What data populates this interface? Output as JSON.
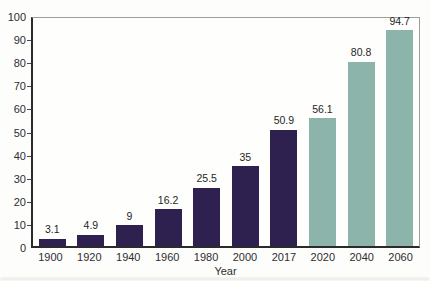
{
  "chart_data": {
    "type": "bar",
    "title": "",
    "xlabel": "Year",
    "ylabel": "",
    "ylim": [
      0,
      100
    ],
    "ytick_step": 10,
    "grid": false,
    "legend_position": "none",
    "categories": [
      "1900",
      "1920",
      "1940",
      "1960",
      "1980",
      "2000",
      "2017",
      "2020",
      "2040",
      "2060"
    ],
    "values": [
      3.1,
      4.9,
      9,
      16.2,
      25.5,
      35,
      50.9,
      56.1,
      80.8,
      94.7
    ],
    "value_labels": [
      "3.1",
      "4.9",
      "9",
      "16.2",
      "25.5",
      "35",
      "50.9",
      "56.1",
      "80.8",
      "94.7"
    ],
    "bar_groups": [
      "historical",
      "historical",
      "historical",
      "historical",
      "historical",
      "historical",
      "historical",
      "projected",
      "projected",
      "projected"
    ],
    "colors": {
      "historical": "#2e2150",
      "projected": "#8db4ab",
      "axis_dark": "#2b2b2e",
      "frame_light": "#9e9e9a",
      "text": "#2d2d30"
    }
  }
}
